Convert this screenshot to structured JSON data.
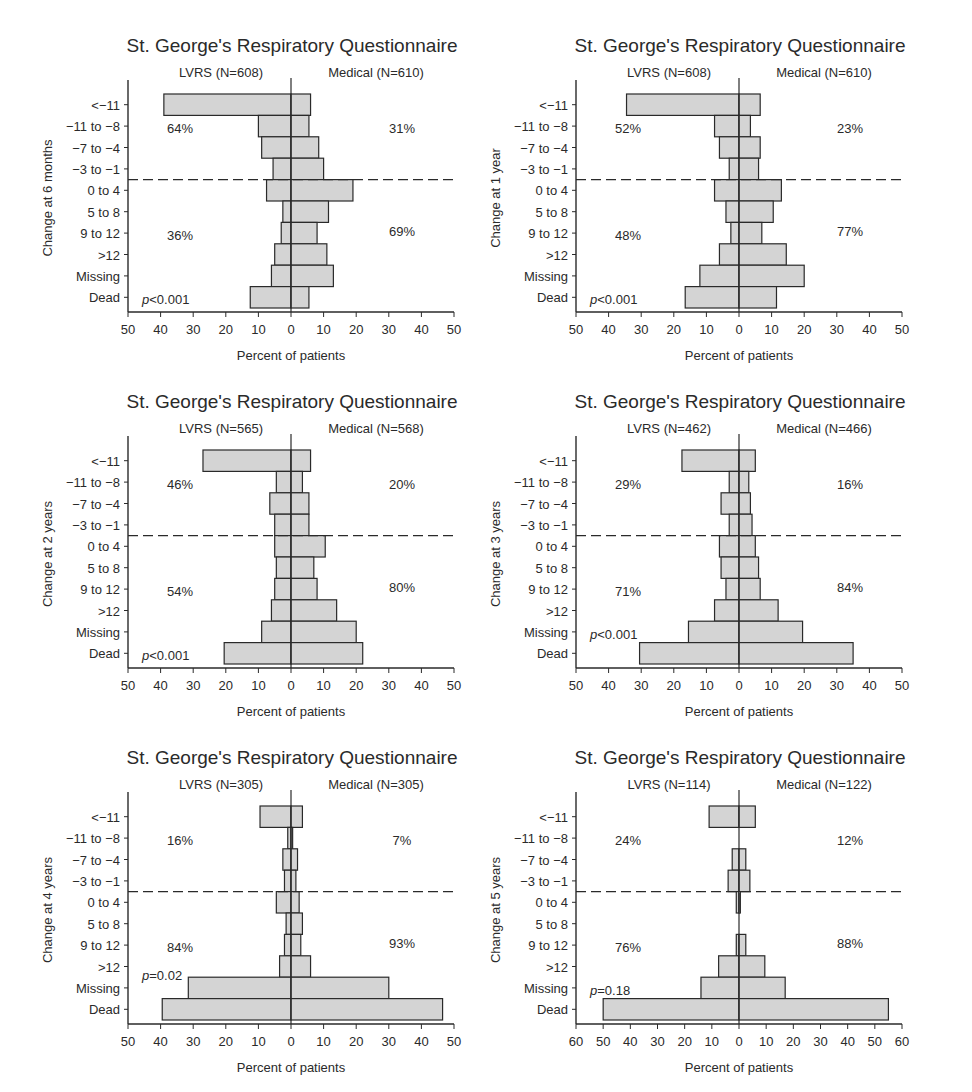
{
  "chart_data": [
    {
      "type": "bar",
      "orientation": "horizontal-butterfly",
      "title": "St. George's Respiratory Questionnaire",
      "ylabel": "Change at 6 months",
      "xlabel": "Percent of patients",
      "left_label": "LVRS (N=608)",
      "right_label": "Medical (N=610)",
      "categories": [
        "<−11",
        "−11 to −8",
        "−7 to −4",
        "−3 to −1",
        "0 to 4",
        "5 to 8",
        "9 to 12",
        ">12",
        "Missing",
        "Dead"
      ],
      "series": [
        {
          "name": "LVRS (N=608)",
          "values": [
            39,
            10,
            9,
            5.5,
            7.5,
            2.5,
            3,
            5,
            6,
            12.5
          ]
        },
        {
          "name": "Medical (N=610)",
          "values": [
            6,
            5.5,
            8.5,
            10,
            19,
            11.5,
            8,
            11,
            13,
            5.5
          ]
        }
      ],
      "xlim": [
        50,
        50
      ],
      "xticks": [
        50,
        40,
        30,
        20,
        10,
        0,
        10,
        20,
        30,
        40,
        50
      ],
      "annotations": {
        "left_top": "64%",
        "right_top": "31%",
        "left_bottom": "36%",
        "right_bottom": "69%",
        "p_value": "p<0.001",
        "p_row": 9
      },
      "divider_after_index": 3
    },
    {
      "type": "bar",
      "orientation": "horizontal-butterfly",
      "title": "St. George's Respiratory Questionnaire",
      "ylabel": "Change at 1 year",
      "xlabel": "Percent of patients",
      "left_label": "LVRS (N=608)",
      "right_label": "Medical (N=610)",
      "categories": [
        "<−11",
        "−11 to −8",
        "−7 to −4",
        "−3 to −1",
        "0 to 4",
        "5 to 8",
        "9 to 12",
        ">12",
        "Missing",
        "Dead"
      ],
      "series": [
        {
          "name": "LVRS (N=608)",
          "values": [
            34.5,
            7.5,
            6,
            3,
            7.5,
            4,
            2.5,
            6,
            12,
            16.5
          ]
        },
        {
          "name": "Medical (N=610)",
          "values": [
            6.5,
            3.5,
            6.5,
            6,
            13,
            10.5,
            7,
            14.5,
            20,
            11.5
          ]
        }
      ],
      "xlim": [
        50,
        50
      ],
      "xticks": [
        50,
        40,
        30,
        20,
        10,
        0,
        10,
        20,
        30,
        40,
        50
      ],
      "annotations": {
        "left_top": "52%",
        "right_top": "23%",
        "left_bottom": "48%",
        "right_bottom": "77%",
        "p_value": "p<0.001",
        "p_row": 9
      },
      "divider_after_index": 3
    },
    {
      "type": "bar",
      "orientation": "horizontal-butterfly",
      "title": "St. George's Respiratory Questionnaire",
      "ylabel": "Change at 2 years",
      "xlabel": "Percent of patients",
      "left_label": "LVRS (N=565)",
      "right_label": "Medical (N=568)",
      "categories": [
        "<−11",
        "−11 to −8",
        "−7 to −4",
        "−3 to −1",
        "0 to 4",
        "5 to 8",
        "9 to 12",
        ">12",
        "Missing",
        "Dead"
      ],
      "series": [
        {
          "name": "LVRS (N=565)",
          "values": [
            27,
            4.5,
            6.5,
            5,
            5,
            4.5,
            5,
            6,
            9,
            20.5
          ]
        },
        {
          "name": "Medical (N=568)",
          "values": [
            6,
            3.5,
            5.5,
            5.5,
            10.5,
            7,
            8,
            14,
            20,
            22
          ]
        }
      ],
      "xlim": [
        50,
        50
      ],
      "xticks": [
        50,
        40,
        30,
        20,
        10,
        0,
        10,
        20,
        30,
        40,
        50
      ],
      "annotations": {
        "left_top": "46%",
        "right_top": "20%",
        "left_bottom": "54%",
        "right_bottom": "80%",
        "p_value": "p<0.001",
        "p_row": 9
      },
      "divider_after_index": 3
    },
    {
      "type": "bar",
      "orientation": "horizontal-butterfly",
      "title": "St. George's Respiratory Questionnaire",
      "ylabel": "Change at 3 years",
      "xlabel": "Percent of patients",
      "left_label": "LVRS (N=462)",
      "right_label": "Medical (N=466)",
      "categories": [
        "<−11",
        "−11 to −8",
        "−7 to −4",
        "−3 to −1",
        "0 to 4",
        "5 to 8",
        "9 to 12",
        ">12",
        "Missing",
        "Dead"
      ],
      "series": [
        {
          "name": "LVRS (N=462)",
          "values": [
            17.5,
            3,
            5.5,
            3,
            6,
            5.5,
            4,
            7.5,
            15.5,
            30.5
          ]
        },
        {
          "name": "Medical (N=466)",
          "values": [
            5,
            3,
            3.5,
            4,
            5,
            6,
            6.5,
            12,
            19.5,
            35
          ]
        }
      ],
      "xlim": [
        50,
        50
      ],
      "xticks": [
        50,
        40,
        30,
        20,
        10,
        0,
        10,
        20,
        30,
        40,
        50
      ],
      "annotations": {
        "left_top": "29%",
        "right_top": "16%",
        "left_bottom": "71%",
        "right_bottom": "84%",
        "p_value": "p<0.001",
        "p_row": 8
      },
      "divider_after_index": 3
    },
    {
      "type": "bar",
      "orientation": "horizontal-butterfly",
      "title": "St. George's Respiratory Questionnaire",
      "ylabel": "Change at 4 years",
      "xlabel": "Percent of patients",
      "left_label": "LVRS (N=305)",
      "right_label": "Medical (N=305)",
      "categories": [
        "<−11",
        "−11 to −8",
        "−7 to −4",
        "−3 to −1",
        "0 to 4",
        "5 to 8",
        "9 to 12",
        ">12",
        "Missing",
        "Dead"
      ],
      "series": [
        {
          "name": "LVRS (N=305)",
          "values": [
            9.5,
            1,
            2.5,
            2,
            4.5,
            1.5,
            2,
            3.5,
            31.5,
            39.5
          ]
        },
        {
          "name": "Medical (N=305)",
          "values": [
            3.5,
            0.5,
            2,
            1.5,
            2.5,
            3.5,
            3,
            6,
            30,
            46.5
          ]
        }
      ],
      "xlim": [
        50,
        50
      ],
      "xticks": [
        50,
        40,
        30,
        20,
        10,
        0,
        10,
        20,
        30,
        40,
        50
      ],
      "annotations": {
        "left_top": "16%",
        "right_top": "7%",
        "left_bottom": "84%",
        "right_bottom": "93%",
        "p_value": "p=0.02",
        "p_row": 7.3
      },
      "divider_after_index": 3
    },
    {
      "type": "bar",
      "orientation": "horizontal-butterfly",
      "title": "St. George's Respiratory Questionnaire",
      "ylabel": "Change at 5 years",
      "xlabel": "Percent of patients",
      "left_label": "LVRS (N=114)",
      "right_label": "Medical (N=122)",
      "categories": [
        "<−11",
        "−11 to −8",
        "−7 to −4",
        "−3 to −1",
        "0 to 4",
        "5 to 8",
        "9 to 12",
        ">12",
        "Missing",
        "Dead"
      ],
      "series": [
        {
          "name": "LVRS (N=114)",
          "values": [
            11,
            0,
            2.5,
            4,
            1,
            0,
            1,
            7.5,
            14,
            50
          ]
        },
        {
          "name": "Medical (N=122)",
          "values": [
            6,
            0,
            2.5,
            4,
            0.5,
            0,
            2.5,
            9.5,
            17,
            55
          ]
        }
      ],
      "xlim": [
        60,
        60
      ],
      "xticks": [
        60,
        50,
        40,
        30,
        20,
        10,
        0,
        10,
        20,
        30,
        40,
        50,
        60
      ],
      "annotations": {
        "left_top": "24%",
        "right_top": "12%",
        "left_bottom": "76%",
        "right_bottom": "88%",
        "p_value": "p=0.18",
        "p_row": 8
      },
      "divider_after_index": 3
    }
  ],
  "panels": [
    {
      "id": "6-months"
    },
    {
      "id": "1-year"
    },
    {
      "id": "2-years"
    },
    {
      "id": "3-years"
    },
    {
      "id": "4-years"
    },
    {
      "id": "5-years"
    }
  ],
  "style": {
    "bar_fill": "#d4d4d4",
    "bar_stroke": "#2a2a2a",
    "text_color": "#2a2a2a",
    "background": "#ffffff"
  }
}
